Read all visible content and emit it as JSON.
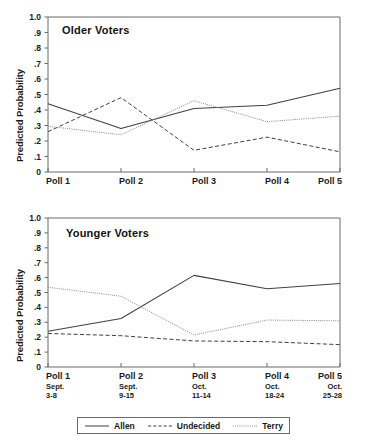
{
  "figure": {
    "ylabel": "Predicted Probability",
    "y_ticks": [
      "1.0",
      ".9",
      ".8",
      ".7",
      ".6",
      ".5",
      ".4",
      ".3",
      ".2",
      ".1",
      "0"
    ],
    "y_tick_values": [
      1.0,
      0.9,
      0.8,
      0.7,
      0.6,
      0.5,
      0.4,
      0.3,
      0.2,
      0.1,
      0.0
    ],
    "ylim": [
      0,
      1.0
    ],
    "x_categories": [
      "Poll 1",
      "Poll 2",
      "Poll 3",
      "Poll 4",
      "Poll 5"
    ],
    "x_dates_month": [
      "Sept.",
      "Sept.",
      "Oct.",
      "Oct.",
      "Oct."
    ],
    "x_dates_days": [
      "3-8",
      "9-15",
      "11-14",
      "18-24",
      "25-28"
    ]
  },
  "legend": {
    "position": "bottom-center",
    "entries": [
      {
        "label": "Allen",
        "style": "solid",
        "color": "#404040"
      },
      {
        "label": "Undecided",
        "style": "dashed",
        "color": "#404040"
      },
      {
        "label": "Terry",
        "style": "dotted",
        "color": "#8a8a8a"
      }
    ]
  },
  "chart_data": [
    {
      "type": "line",
      "title": "Older Voters",
      "xlabel": "",
      "ylabel": "Predicted Probability",
      "ylim": [
        0,
        1.0
      ],
      "grid": false,
      "legend": "bottom-center",
      "categories": [
        "Poll 1",
        "Poll 2",
        "Poll 3",
        "Poll 4",
        "Poll 5"
      ],
      "series": [
        {
          "name": "Allen",
          "style": "solid",
          "values": [
            0.44,
            0.28,
            0.41,
            0.43,
            0.54
          ]
        },
        {
          "name": "Undecided",
          "style": "dashed",
          "values": [
            0.26,
            0.48,
            0.14,
            0.225,
            0.13
          ]
        },
        {
          "name": "Terry",
          "style": "dotted",
          "values": [
            0.295,
            0.24,
            0.46,
            0.325,
            0.36
          ]
        }
      ]
    },
    {
      "type": "line",
      "title": "Younger Voters",
      "xlabel": "",
      "ylabel": "Predicted Probability",
      "ylim": [
        0,
        1.0
      ],
      "grid": false,
      "legend": "bottom-center",
      "categories": [
        "Poll 1",
        "Poll 2",
        "Poll 3",
        "Poll 4",
        "Poll 5"
      ],
      "series": [
        {
          "name": "Allen",
          "style": "solid",
          "values": [
            0.24,
            0.325,
            0.615,
            0.525,
            0.56
          ]
        },
        {
          "name": "Undecided",
          "style": "dashed",
          "values": [
            0.225,
            0.21,
            0.175,
            0.17,
            0.15
          ]
        },
        {
          "name": "Terry",
          "style": "dotted",
          "values": [
            0.535,
            0.475,
            0.215,
            0.315,
            0.31
          ]
        }
      ]
    }
  ]
}
